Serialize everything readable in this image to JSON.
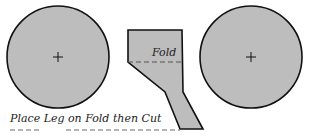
{
  "diagram": {
    "type": "sewing-pattern",
    "colors": {
      "fill": "#bdbdbd",
      "stroke": "#111111",
      "dash": "#555555",
      "text": "#222222"
    },
    "pieces": {
      "left_circle": {
        "cx": 58,
        "cy": 57,
        "r": 51,
        "mark": "+"
      },
      "right_circle": {
        "cx": 251,
        "cy": 57,
        "r": 51,
        "mark": "+"
      },
      "leg": {
        "points": "128,30 182,30 183,92 203,129 180,129 165,92 128,62"
      }
    },
    "labels": {
      "fold": "Fold",
      "instruction": "Place Leg on Fold then Cut"
    }
  }
}
